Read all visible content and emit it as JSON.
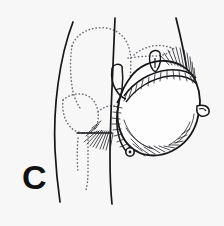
{
  "figure": {
    "panel_label": "C",
    "caption_visible": false,
    "background_color": "#f7f7f7",
    "ink_color": "#16161a",
    "dotted_color": "#6e6e78",
    "width": 224,
    "height": 226
  },
  "illustration": {
    "title": "Surgical line drawing of chest wall and reconstructed breast mound",
    "type": "medical-line-drawing",
    "view": "oblique anterolateral torso",
    "parts": [
      {
        "name": "torso-contour",
        "style": "solid-line",
        "description": "Anterior torso and flank outline descending at left"
      },
      {
        "name": "shoulder-contour",
        "style": "solid-line",
        "description": "Upper arm / shoulder edge at right"
      },
      {
        "name": "scapula-outline",
        "style": "dotted-line",
        "description": "Dotted underlying bony landmark, upper left"
      },
      {
        "name": "rib-cage-outline",
        "style": "dotted-line",
        "description": "Dotted thoracic landmark, mid left"
      },
      {
        "name": "breast-mound",
        "style": "solid-line",
        "description": "Large rounded reconstructed mound at right"
      },
      {
        "name": "mound-ghost-outline",
        "style": "dotted-line",
        "description": "Dotted prior breast contour beneath the mound"
      },
      {
        "name": "suture-line",
        "style": "stitched-line",
        "description": "Running closure across superior aspect of the mound"
      },
      {
        "name": "medial-incision-stitches",
        "style": "stitched-line",
        "description": "Vertical stitched closure on medial edge of the mound"
      },
      {
        "name": "vascular-pedicle",
        "style": "solid-line",
        "description": "Forked vessel loop medial to the mound"
      },
      {
        "name": "vessel-clip-detail",
        "style": "solid-line",
        "description": "Small forked vessel structure above the suture line"
      },
      {
        "name": "nipple-areola-marker",
        "style": "solid-circle",
        "description": "Small circular marker at inferomedial mound border"
      },
      {
        "name": "lateral-tab-flap",
        "style": "solid-line",
        "description": "Small tab of tissue at lateral mound border"
      },
      {
        "name": "axillary-hatching",
        "style": "hatching",
        "description": "Shading strokes radiating into the axilla"
      },
      {
        "name": "superior-hatching",
        "style": "hatching",
        "description": "Shading strokes along the superolateral shoulder"
      },
      {
        "name": "inferior-hatching",
        "style": "hatching",
        "description": "Shading strokes along the inferior mound curve"
      }
    ]
  }
}
